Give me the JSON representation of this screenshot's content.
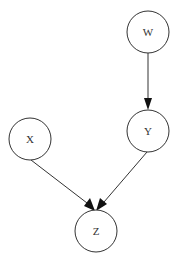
{
  "diagram": {
    "type": "directed-graph",
    "nodes": [
      {
        "id": "W",
        "label": "W",
        "cx": 148,
        "cy": 32,
        "r": 21
      },
      {
        "id": "X",
        "label": "X",
        "cx": 30,
        "cy": 139,
        "r": 21
      },
      {
        "id": "Y",
        "label": "Y",
        "cx": 148,
        "cy": 131,
        "r": 21
      },
      {
        "id": "Z",
        "label": "Z",
        "cx": 96,
        "cy": 231,
        "r": 21
      }
    ],
    "edges": [
      {
        "from": "W",
        "to": "Y"
      },
      {
        "from": "X",
        "to": "Z"
      },
      {
        "from": "Y",
        "to": "Z"
      }
    ],
    "colors": {
      "background": "#ffffff",
      "stroke": "#333333",
      "arrow": "#111111",
      "text": "#333333"
    }
  }
}
